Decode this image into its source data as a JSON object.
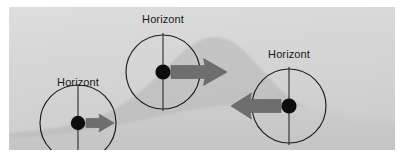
{
  "figure": {
    "name": "horizont-hill-diagram",
    "canvas": {
      "width": 408,
      "height": 160
    },
    "plate": {
      "x": 9,
      "y": 7,
      "width": 386,
      "height": 143
    },
    "colors": {
      "page_background": "#ffffff",
      "sky_background": "#d3d3d3",
      "sky_background_light": "#dcdcdc",
      "hill_fill": "#c2c2c2",
      "foreground_fill": "#cacaca",
      "circle_stroke": "#1c1c1c",
      "plumb_line": "#2a2a2a",
      "center_dot": "#111111",
      "arrow_fill": "#6e6e6e",
      "arrow_stroke": "#5a5a5a",
      "label_text": "#191919"
    },
    "background": {
      "name": "hill-profile",
      "description": "Grey hill silhouette rising from the lower left to a rounded summit near the centre-right, then falling away to the right edge.",
      "summit": {
        "x": 213,
        "y": 38
      }
    },
    "markers": [
      {
        "id": "marker-left",
        "label": "Horizont",
        "center": {
          "x": 78,
          "y": 123
        },
        "radius": 38,
        "label_position": {
          "x": 78,
          "y": 86
        },
        "arrow": {
          "direction": "right",
          "name": "arrow-right-small",
          "length": 28,
          "shaft_height": 9,
          "head_height": 18,
          "start": {
            "x": 86,
            "y": 123
          },
          "end": {
            "x": 114,
            "y": 123
          }
        }
      },
      {
        "id": "marker-middle",
        "label": "Horizont",
        "center": {
          "x": 163,
          "y": 72
        },
        "radius": 37,
        "label_position": {
          "x": 163,
          "y": 23
        },
        "arrow": {
          "direction": "right",
          "name": "arrow-right-large",
          "length": 56,
          "shaft_height": 13,
          "head_height": 27,
          "start": {
            "x": 171,
            "y": 72
          },
          "end": {
            "x": 227,
            "y": 72
          }
        }
      },
      {
        "id": "marker-right",
        "label": "Horizont",
        "center": {
          "x": 289,
          "y": 106
        },
        "radius": 37,
        "label_position": {
          "x": 289,
          "y": 58
        },
        "arrow": {
          "direction": "left",
          "name": "arrow-left-large",
          "length": 50,
          "shaft_height": 13,
          "head_height": 26,
          "start": {
            "x": 281,
            "y": 106
          },
          "end": {
            "x": 231,
            "y": 106
          }
        }
      }
    ]
  }
}
